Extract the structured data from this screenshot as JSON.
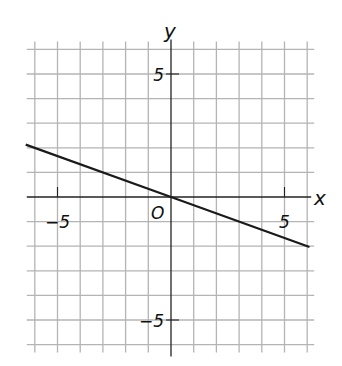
{
  "chart_data": {
    "type": "line",
    "title": "",
    "xlabel": "x",
    "ylabel": "y",
    "origin_label": "O",
    "xlim": [
      -6,
      6
    ],
    "ylim": [
      -6,
      6
    ],
    "grid": true,
    "grid_step": 1,
    "x_ticks": [
      {
        "value": -5,
        "label": "−5"
      },
      {
        "value": 5,
        "label": "5"
      }
    ],
    "y_ticks": [
      {
        "value": 5,
        "label": "5"
      },
      {
        "value": -5,
        "label": "−5"
      }
    ],
    "series": [
      {
        "name": "line through origin",
        "equation": "y = -x/3",
        "slope": -0.3333,
        "intercept": 0,
        "x": [
          -6.4,
          0,
          6.1
        ],
        "y": [
          2.13,
          0,
          -2.03
        ]
      }
    ],
    "legend": null
  }
}
